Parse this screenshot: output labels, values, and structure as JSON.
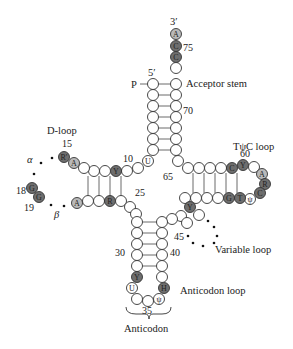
{
  "figure": {
    "colors": {
      "open": "#ffffff",
      "conserved_light": "#b9b9b9",
      "conserved_dark": "#6e6e6e",
      "stroke": "#333333"
    }
  },
  "labels": {
    "three_prime": "3′",
    "five_prime": "5′",
    "phosphate": "P",
    "acceptor_stem": "Acceptor stem",
    "d_loop": "D-loop",
    "tpsic_loop": "TψC loop",
    "variable_loop": "Variable loop",
    "anticodon_loop": "Anticodon loop",
    "anticodon": "Anticodon",
    "alpha": "α",
    "beta": "β"
  },
  "numbers": {
    "n75": "75",
    "n70": "70",
    "n65": "65",
    "n60": "60",
    "n15": "15",
    "n10": "10",
    "n18": "18",
    "n19": "19",
    "n25": "25",
    "n30": "30",
    "n40": "40",
    "n45": "45",
    "n35": "35"
  },
  "nucleotides": {
    "a76": "A",
    "c75": "C",
    "c74": "C",
    "u8": "U",
    "y11": "Y",
    "r14": "R′",
    "a14": "A",
    "g18": "G",
    "g19": "G",
    "a21": "A",
    "r24": "R",
    "c61": "C",
    "y60": "Y",
    "a58": "A",
    "r57": "R",
    "c56": "C",
    "g53": "G",
    "t54": "T",
    "psi55": "ψ",
    "y48": "Y",
    "y32": "Y",
    "u33": "U",
    "h37": "H",
    "psi35": "ψ"
  }
}
